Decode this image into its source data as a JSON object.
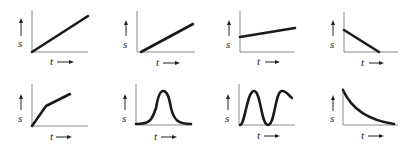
{
  "figure": {
    "y_axis_label": "s",
    "x_axis_label": "t",
    "panels": [
      {
        "id": 1,
        "row": 1,
        "col": 1,
        "description": "straight line from origin, positive slope",
        "curve": "M32,52 L88,16"
      },
      {
        "id": 2,
        "row": 1,
        "col": 2,
        "description": "straight line starting on t-axis after origin, positive slope",
        "curve": "M38,52 L90,24"
      },
      {
        "id": 3,
        "row": 1,
        "col": 3,
        "description": "straight line starting above origin, small positive slope",
        "curve": "M35,37 L90,28"
      },
      {
        "id": 4,
        "row": 1,
        "col": 4,
        "description": "straight line starting above origin, negative slope reaching t-axis",
        "curve": "M39,30 L74,52"
      },
      {
        "id": 5,
        "row": 2,
        "col": 1,
        "description": "piecewise linear from origin, steep then shallower slope",
        "curve": "M32,50 L46,30 L70,18"
      },
      {
        "id": 6,
        "row": 2,
        "col": 2,
        "description": "single bell-shaped pulse",
        "curve": "M36,48 C50,48 52,44 56,32 C58,20 60,15 63,15 C67,15 69,20 71,32 C74,44 78,48 91,48"
      },
      {
        "id": 7,
        "row": 2,
        "col": 3,
        "description": "oscillating sinusoidal curve",
        "curve": "M35,49 C40,49 42,15 49,15 C56,15 56,49 63,49 C70,49 70,15 77,15 C82,15 84,20 87,22"
      },
      {
        "id": 8,
        "row": 2,
        "col": 4,
        "description": "decaying curve, decreasing toward t-axis",
        "curve": "M38,14 C46,32 62,44 89,48"
      }
    ]
  },
  "colors": {
    "curve": "#1a1a1a",
    "axis": "#8a8a8a",
    "text": "#222222",
    "background": "#ffffff"
  }
}
